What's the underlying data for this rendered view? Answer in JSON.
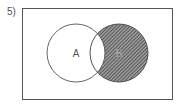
{
  "problem_number": "5)",
  "diagram": {
    "type": "venn",
    "sets": [
      {
        "label": "A",
        "shaded": false
      },
      {
        "label": "B",
        "shaded": true
      }
    ],
    "shaded_region": "B only (B minus A)",
    "colors": {
      "stroke": "#555555",
      "hatch": "#444444",
      "background": "#ffffff"
    }
  }
}
